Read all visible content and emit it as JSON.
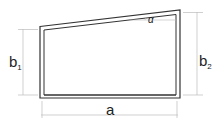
{
  "diagram": {
    "type": "trapezoid-frame",
    "labels": {
      "left_height": "b",
      "left_height_sub": "1",
      "right_height": "b",
      "right_height_sub": "2",
      "width": "a",
      "angle": "α"
    },
    "colors": {
      "frame": "#333333",
      "dimension": "#bbbbbb",
      "text": "#222222",
      "background": "#ffffff"
    }
  }
}
